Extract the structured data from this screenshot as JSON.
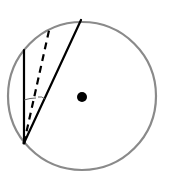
{
  "diagram": {
    "circle": {
      "cx": 82,
      "cy": 96,
      "r": 74,
      "stroke": "#8a8a8a",
      "stroke_width": 2.2
    },
    "center_dot": {
      "cx": 82,
      "cy": 97,
      "r": 5,
      "fill": "#000000"
    },
    "vertex": {
      "x": 24,
      "y": 143
    },
    "lines": [
      {
        "name": "vertical-chord",
        "x1": 24,
        "y1": 143,
        "x2": 24,
        "y2": 50,
        "style": "solid",
        "stroke": "#000000",
        "width": 2.2
      },
      {
        "name": "dashed-chord",
        "x1": 24,
        "y1": 143,
        "x2": 50,
        "y2": 26,
        "style": "dashed",
        "stroke": "#000000",
        "width": 2.2
      },
      {
        "name": "slanted-chord",
        "x1": 24,
        "y1": 143,
        "x2": 81,
        "y2": 20,
        "style": "solid",
        "stroke": "#000000",
        "width": 2.2
      }
    ],
    "angle_marks": [
      {
        "name": "angle-arc-left",
        "path": "M24 100 Q 30 98 36 98"
      },
      {
        "name": "angle-arc-right",
        "path": "M38 97 Q 42 96 45 99"
      }
    ],
    "labels": []
  }
}
